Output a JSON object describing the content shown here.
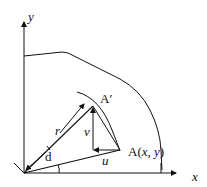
{
  "diagram": {
    "axis_x_label": "x",
    "axis_y_label": "y",
    "point_A_prime": "A′",
    "point_A_prefix": "A(",
    "point_A_x": "x",
    "point_A_sep": ", ",
    "point_A_y": "y",
    "point_A_suffix": ")",
    "label_r": "r",
    "label_v": "v",
    "label_u": "u",
    "label_d": "d",
    "stroke_color": "#111111"
  }
}
